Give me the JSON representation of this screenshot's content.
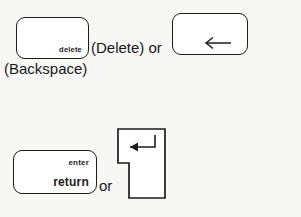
{
  "diagram": {
    "background_color": "#f7f7f5",
    "key_face_color": "#ffffff",
    "key_outline_color": "#1d1d1d",
    "text_color": "#1a1a1a"
  },
  "rows": [
    {
      "id": "delete-row",
      "keys": [
        {
          "id": "delete-key",
          "shape": "rounded-rect",
          "label": "delete",
          "label_align": "bottom-right"
        },
        {
          "id": "backspace-key",
          "shape": "rounded-rect",
          "label": "",
          "icon": "left-arrow-icon",
          "icon_glyph": "←",
          "icon_align": "bottom-right"
        }
      ],
      "captions": [
        {
          "id": "caption-delete-or",
          "text": "(Delete) or"
        },
        {
          "id": "caption-backspace",
          "text": "(Backspace)"
        }
      ]
    },
    {
      "id": "return-row",
      "keys": [
        {
          "id": "return-key",
          "shape": "rounded-rect",
          "label_top": "enter",
          "label_bottom": "return",
          "label_align": "right"
        },
        {
          "id": "enter-key",
          "shape": "big-enter-notched",
          "label": "",
          "icon": "return-arrow-icon",
          "icon_glyph": "↵",
          "icon_align": "upper-center"
        }
      ],
      "captions": [
        {
          "id": "caption-or",
          "text": "or"
        }
      ]
    }
  ]
}
